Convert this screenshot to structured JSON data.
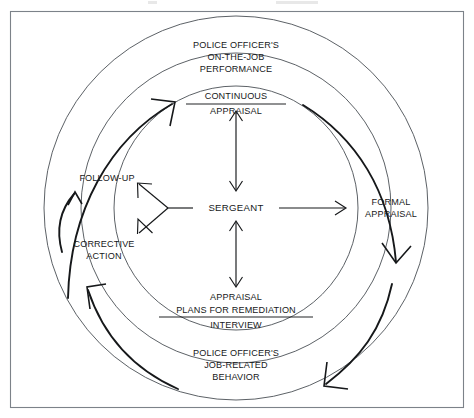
{
  "figure": {
    "type": "cycle-diagram",
    "center_node": {
      "label": "SERGEANT"
    },
    "outer_ring_nodes": [
      {
        "id": "on-the-job-performance",
        "position": "top",
        "lines": [
          "POLICE OFFICER'S",
          "ON-THE-JOB",
          "PERFORMANCE"
        ]
      },
      {
        "id": "job-related-behavior",
        "position": "bottom",
        "lines": [
          "POLICE OFFICER'S",
          "JOB-RELATED",
          "BEHAVIOR"
        ]
      }
    ],
    "inner_ring_nodes": [
      {
        "id": "continuous-appraisal",
        "position": "top",
        "lines": [
          "CONTINUOUS",
          "APPRAISAL"
        ],
        "divider_after_line": 1
      },
      {
        "id": "formal-appraisal",
        "position": "right",
        "lines": [
          "FORMAL",
          "APPRAISAL"
        ]
      },
      {
        "id": "appraisal-interview",
        "position": "bottom",
        "lines": [
          "APPRAISAL",
          "PLANS FOR REMEDIATION",
          "INTERVIEW"
        ],
        "divider_after_line": 2
      },
      {
        "id": "follow-up",
        "position": "upper-left",
        "lines": [
          "FOLLOW-UP"
        ]
      },
      {
        "id": "corrective-action",
        "position": "lower-left",
        "lines": [
          "CORRECTIVE",
          "ACTION"
        ]
      }
    ],
    "connectors": [
      {
        "id": "sergeant-to-continuous-appraisal",
        "from": "SERGEANT",
        "to": "CONTINUOUS APPRAISAL",
        "style": "double-headed-vertical"
      },
      {
        "id": "sergeant-to-formal-appraisal",
        "from": "SERGEANT",
        "to": "FORMAL APPRAISAL",
        "style": "single-headed-horizontal"
      },
      {
        "id": "sergeant-to-appraisal-interview",
        "from": "SERGEANT",
        "to": "APPRAISAL INTERVIEW",
        "style": "double-headed-vertical"
      },
      {
        "id": "sergeant-to-follow-up-and-corrective-action",
        "from": "SERGEANT",
        "to": "FOLLOW-UP / CORRECTIVE ACTION",
        "style": "forked-two-headed"
      },
      {
        "id": "corrective-action-to-follow-up",
        "from": "CORRECTIVE ACTION",
        "to": "FOLLOW-UP",
        "style": "curved-single-headed"
      }
    ],
    "cycle_arrows": [
      {
        "id": "cycle-arrow-top-left",
        "direction": "clockwise",
        "quadrant": "upper-left"
      },
      {
        "id": "cycle-arrow-top-right",
        "direction": "clockwise",
        "quadrant": "upper-right"
      },
      {
        "id": "cycle-arrow-bottom-right",
        "direction": "clockwise",
        "quadrant": "lower-right"
      },
      {
        "id": "cycle-arrow-bottom-left",
        "direction": "clockwise",
        "quadrant": "lower-left"
      }
    ],
    "colors": {
      "ink": "#16181a",
      "ring_stroke": "#4a4f55",
      "frame_stroke": "#7c8289",
      "background": "#ffffff"
    }
  }
}
